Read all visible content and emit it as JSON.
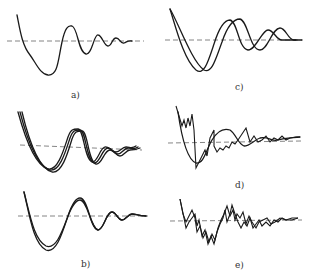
{
  "figure": {
    "panels": [
      {
        "id": "a",
        "label": "a)",
        "description": "single damped oscillation about dashed reference line"
      },
      {
        "id": "b",
        "label": "b)",
        "description": "two stacked plots, each with two nearly overlapping damped oscillations"
      },
      {
        "id": "c",
        "label": "c)",
        "description": "two phase-shifted damped oscillations"
      },
      {
        "id": "d",
        "label": "d)",
        "description": "smooth damped oscillation overlaid with noisy jagged response"
      },
      {
        "id": "e",
        "label": "e)",
        "description": "two noisy jagged damped responses"
      }
    ],
    "reference_line_style": "dashed",
    "line_color": "#1a1a1a",
    "reference_color": "#777777"
  }
}
